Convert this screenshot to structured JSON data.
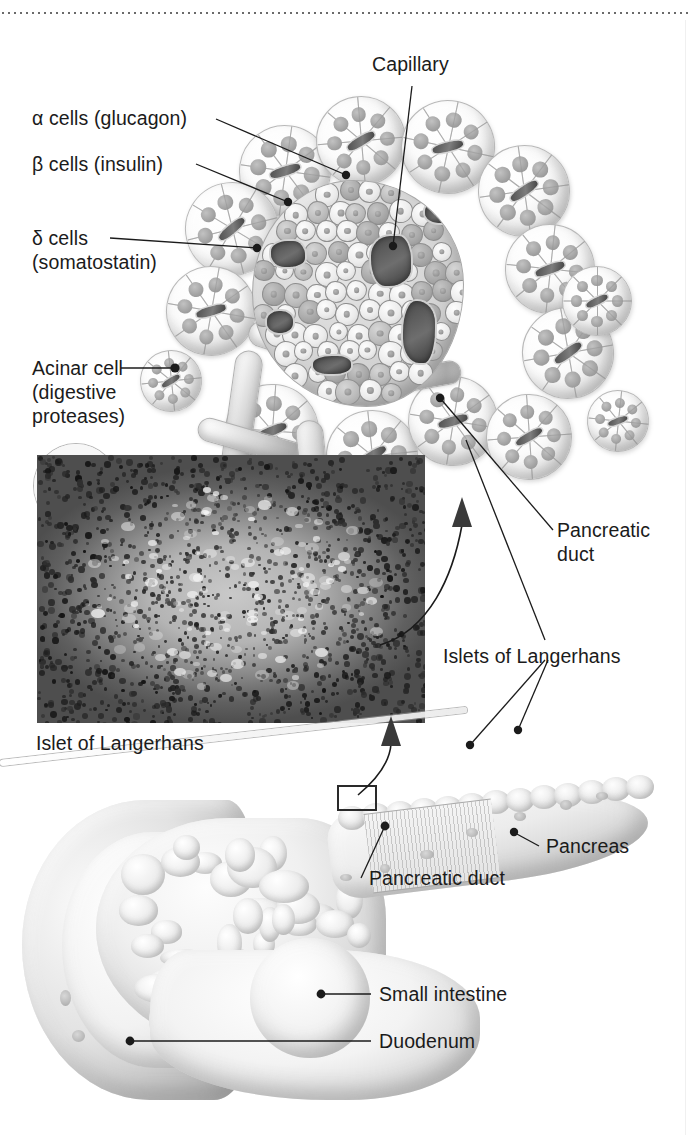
{
  "figure": {
    "title_visible": false,
    "type": "anatomical-illustration"
  },
  "panels": {
    "islet_diagram": {
      "name": "islet-and-acini-diagram"
    },
    "micrograph": {
      "name": "islet-micrograph",
      "caption": "Islet of Langerhans"
    },
    "organ": {
      "name": "pancreas-organ-diagram"
    }
  },
  "labels": {
    "capillary": "Capillary",
    "alpha_cells": "α cells (glucagon)",
    "beta_cells": "β cells (insulin)",
    "delta_cells": "δ cells\n(somatostatin)",
    "acinar_cell": "Acinar cell\n(digestive\nproteases)",
    "pancreatic_duct_top": "Pancreatic\nduct",
    "islets_of_langerhans": "Islets of Langerhans",
    "micrograph_caption": "Islet of Langerhans",
    "pancreas": "Pancreas",
    "pancreatic_duct_bottom": "Pancreatic duct",
    "small_intestine": "Small intestine",
    "duodenum": "Duodenum"
  },
  "colors": {
    "text": "#1b1b1b",
    "leader_line": "#1b1b1b",
    "background": "#ffffff",
    "rule": "#6a6a6a"
  }
}
